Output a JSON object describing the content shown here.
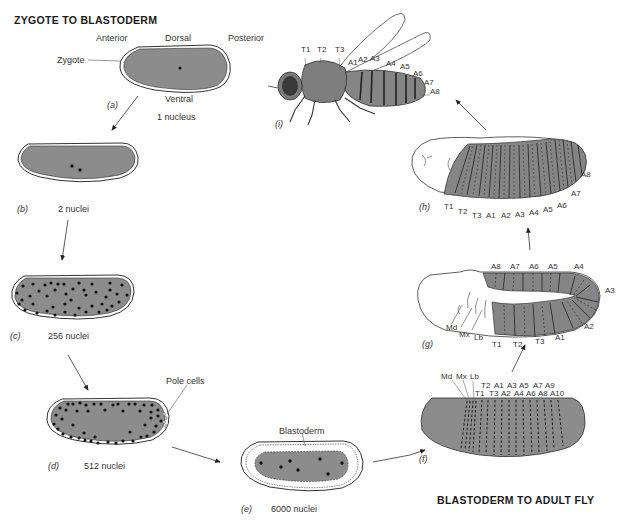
{
  "sections": {
    "top_left_title": "ZYGOTE TO BLASTODERM",
    "bottom_right_title": "BLASTODERM TO ADULT FLY"
  },
  "orientation": {
    "anterior": "Anterior",
    "dorsal": "Dorsal",
    "posterior": "Posterior",
    "ventral": "Ventral"
  },
  "stages": {
    "a": {
      "panel": "(a)",
      "label": "Zygote",
      "count": "1 nucleus"
    },
    "b": {
      "panel": "(b)",
      "count": "2 nuclei"
    },
    "c": {
      "panel": "(c)",
      "count": "256 nuclei"
    },
    "d": {
      "panel": "(d)",
      "count": "512 nuclei",
      "callout": "Pole cells"
    },
    "e": {
      "panel": "(e)",
      "count": "6000 nuclei",
      "callout": "Blastoderm"
    },
    "f": {
      "panel": "(f)",
      "head_labels": [
        "Md",
        "Mx",
        "Lb"
      ],
      "row1": [
        "T2",
        "A1",
        "A3",
        "A5",
        "A7",
        "A9"
      ],
      "row2": [
        "T1",
        "T3",
        "A2",
        "A4",
        "A6",
        "A8",
        "A10"
      ]
    },
    "g": {
      "panel": "(g)",
      "head_labels": [
        "Md",
        "Mx",
        "Lb"
      ],
      "top": [
        "A8",
        "A7",
        "A6",
        "A5",
        "A4"
      ],
      "right": [
        "A3",
        "A2"
      ],
      "bottom": [
        "T1",
        "T2",
        "T3",
        "A1"
      ]
    },
    "h": {
      "panel": "(h)",
      "labels": [
        "T1",
        "T2",
        "T3",
        "A1",
        "A2",
        "A3",
        "A4",
        "A5",
        "A6",
        "A7",
        "A8"
      ]
    },
    "i": {
      "panel": "(i)",
      "thorax": [
        "T1",
        "T2",
        "T3"
      ],
      "abdomen": [
        "A1",
        "A2",
        "A3",
        "A4",
        "A5",
        "A6",
        "A7",
        "A8"
      ]
    }
  },
  "colors": {
    "embryo_fill": "#8c8c8c",
    "segment_fill": "#858585",
    "nucleus": "#111111",
    "outline": "#333333"
  }
}
